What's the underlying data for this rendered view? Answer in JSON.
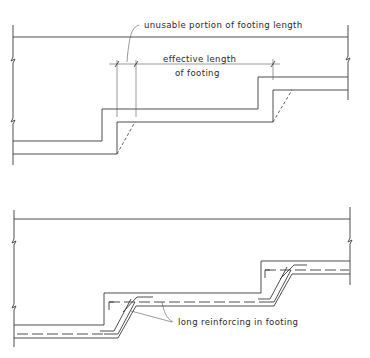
{
  "figure": {
    "top_panel": {
      "title": "stepped footing - effective length",
      "labels": {
        "unusable": "unusable portion of footing length",
        "effective_line1": "effective length",
        "effective_line2": "of footing"
      }
    },
    "bottom_panel": {
      "title": "stepped footing - reinforcing",
      "labels": {
        "reinforcing": "long reinforcing in footing"
      }
    },
    "colors": {
      "line": "#3a3a3a",
      "background": "#ffffff",
      "text": "#2a2a2a"
    }
  }
}
